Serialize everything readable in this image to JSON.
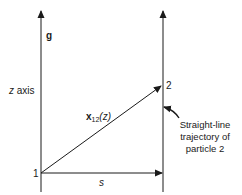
{
  "diagram": {
    "labels": {
      "gravity": "g",
      "z_axis": "z axis",
      "z_axis_var": "z",
      "z_axis_word": " axis",
      "vector_main": "x",
      "vector_sub": "12",
      "vector_arg": "(z)",
      "separation": "s",
      "point_1": "1",
      "point_2": "2",
      "annotation_line1": "Straight-line",
      "annotation_line2": "trajectory of",
      "annotation_line3": "particle 2"
    },
    "colors": {
      "line": "#1a1a1a",
      "background": "#ffffff"
    }
  }
}
